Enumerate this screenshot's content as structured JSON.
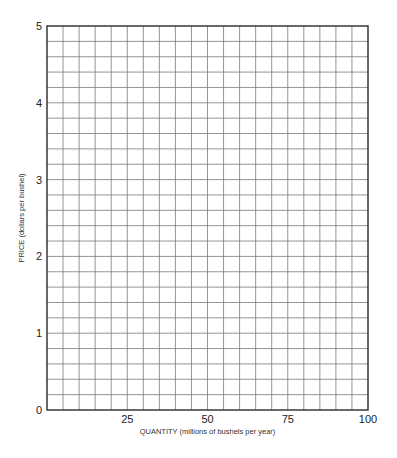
{
  "chart_data": {
    "type": "scatter",
    "title": "",
    "xlabel": "QUANTITY (millions of bushels per year)",
    "ylabel": "PRICE (dollars per bushel)",
    "xlim": [
      0,
      100
    ],
    "ylim": [
      0,
      5
    ],
    "x_ticks": [
      25,
      50,
      75,
      100
    ],
    "x_tick_labels": [
      "25",
      "50",
      "75",
      "100"
    ],
    "y_ticks": [
      0,
      1,
      2,
      3,
      4,
      5
    ],
    "y_tick_labels": [
      "0",
      "1",
      "2",
      "3",
      "4",
      "5"
    ],
    "grid": true,
    "x_grid_step": 5,
    "y_grid_step": 0.2,
    "series": [],
    "legend": "none"
  }
}
